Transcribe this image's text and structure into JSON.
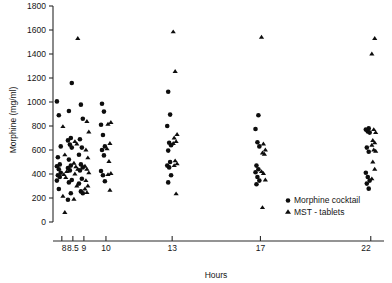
{
  "chart_data": {
    "type": "scatter",
    "title": "",
    "xlabel": "Hours",
    "ylabel": "Morphine (mg/ml)",
    "xtick_labels": [
      "8",
      "8.5",
      "9",
      "10",
      "13",
      "17",
      "22"
    ],
    "xtick_values": [
      8,
      8.5,
      9,
      10,
      13,
      17,
      22
    ],
    "ytick_labels": [
      "0",
      "200",
      "400",
      "600",
      "800",
      "1000",
      "1200",
      "1400",
      "1600",
      "1800"
    ],
    "ytick_values": [
      0,
      200,
      400,
      600,
      800,
      1000,
      1200,
      1400,
      1600,
      1800
    ],
    "ylim": [
      0,
      1800
    ],
    "xlim": [
      7.6,
      22.6
    ],
    "grid": false,
    "legend_position": "lower-right",
    "series": [
      {
        "name": "Morphine cocktail",
        "marker": "circle",
        "color": "#0d0d0d",
        "points": [
          [
            8,
            1005
          ],
          [
            8,
            890
          ],
          [
            8,
            630
          ],
          [
            8,
            540
          ],
          [
            8,
            480
          ],
          [
            8,
            465
          ],
          [
            8,
            440
          ],
          [
            8,
            410
          ],
          [
            8,
            390
          ],
          [
            8,
            375
          ],
          [
            8,
            345
          ],
          [
            8,
            275
          ],
          [
            8.5,
            1158
          ],
          [
            8.5,
            925
          ],
          [
            8.5,
            700
          ],
          [
            8.5,
            680
          ],
          [
            8.5,
            645
          ],
          [
            8.5,
            620
          ],
          [
            8.5,
            520
          ],
          [
            8.5,
            470
          ],
          [
            8.5,
            450
          ],
          [
            8.5,
            430
          ],
          [
            8.5,
            350
          ],
          [
            8.5,
            330
          ],
          [
            8.5,
            240
          ],
          [
            8.5,
            185
          ],
          [
            9,
            978
          ],
          [
            9,
            860
          ],
          [
            9,
            690
          ],
          [
            9,
            620
          ],
          [
            9,
            560
          ],
          [
            9,
            480
          ],
          [
            9,
            455
          ],
          [
            9,
            430
          ],
          [
            9,
            360
          ],
          [
            9,
            320
          ],
          [
            9,
            255
          ],
          [
            9,
            240
          ],
          [
            10,
            985
          ],
          [
            10,
            920
          ],
          [
            10,
            810
          ],
          [
            10,
            725
          ],
          [
            10,
            630
          ],
          [
            10,
            600
          ],
          [
            10,
            555
          ],
          [
            10,
            425
          ],
          [
            10,
            390
          ],
          [
            10,
            340
          ],
          [
            13,
            1085
          ],
          [
            13,
            895
          ],
          [
            13,
            800
          ],
          [
            13,
            660
          ],
          [
            13,
            640
          ],
          [
            13,
            595
          ],
          [
            13,
            500
          ],
          [
            13,
            470
          ],
          [
            13,
            455
          ],
          [
            13,
            390
          ],
          [
            13,
            330
          ],
          [
            17,
            890
          ],
          [
            17,
            775
          ],
          [
            17,
            665
          ],
          [
            17,
            630
          ],
          [
            17,
            470
          ],
          [
            17,
            440
          ],
          [
            17,
            415
          ],
          [
            17,
            375
          ],
          [
            17,
            345
          ],
          [
            17,
            315
          ],
          [
            22,
            780
          ],
          [
            22,
            770
          ],
          [
            22,
            755
          ],
          [
            22,
            745
          ],
          [
            22,
            620
          ],
          [
            22,
            585
          ],
          [
            22,
            410
          ],
          [
            22,
            375
          ],
          [
            22,
            345
          ],
          [
            22,
            320
          ],
          [
            22,
            278
          ]
        ]
      },
      {
        "name": "MST - tablets",
        "marker": "triangle",
        "color": "#0d0d0d",
        "points": [
          [
            8,
            795
          ],
          [
            8,
            560
          ],
          [
            8,
            420
          ],
          [
            8,
            395
          ],
          [
            8,
            370
          ],
          [
            8,
            215
          ],
          [
            8,
            80
          ],
          [
            8.5,
            1530
          ],
          [
            8.5,
            670
          ],
          [
            8.5,
            650
          ],
          [
            8.5,
            490
          ],
          [
            8.5,
            460
          ],
          [
            8.5,
            440
          ],
          [
            8.5,
            400
          ],
          [
            8.5,
            300
          ],
          [
            8.5,
            190
          ],
          [
            9,
            838
          ],
          [
            9,
            750
          ],
          [
            9,
            600
          ],
          [
            9,
            535
          ],
          [
            9,
            465
          ],
          [
            9,
            440
          ],
          [
            9,
            410
          ],
          [
            9,
            345
          ],
          [
            9,
            300
          ],
          [
            9,
            275
          ],
          [
            9,
            245
          ],
          [
            10,
            830
          ],
          [
            10,
            815
          ],
          [
            10,
            655
          ],
          [
            10,
            610
          ],
          [
            10,
            505
          ],
          [
            10,
            405
          ],
          [
            10,
            395
          ],
          [
            10,
            265
          ],
          [
            13,
            1585
          ],
          [
            13,
            1255
          ],
          [
            13,
            730
          ],
          [
            13,
            700
          ],
          [
            13,
            670
          ],
          [
            13,
            655
          ],
          [
            13,
            510
          ],
          [
            13,
            485
          ],
          [
            13,
            470
          ],
          [
            13,
            235
          ],
          [
            17,
            1540
          ],
          [
            17,
            650
          ],
          [
            17,
            600
          ],
          [
            17,
            575
          ],
          [
            17,
            565
          ],
          [
            17,
            420
          ],
          [
            17,
            405
          ],
          [
            17,
            350
          ],
          [
            17,
            120
          ],
          [
            22,
            1530
          ],
          [
            22,
            1400
          ],
          [
            22,
            770
          ],
          [
            22,
            745
          ],
          [
            22,
            680
          ],
          [
            22,
            660
          ],
          [
            22,
            640
          ],
          [
            22,
            600
          ],
          [
            22,
            590
          ],
          [
            22,
            500
          ],
          [
            22,
            440
          ],
          [
            22,
            360
          ]
        ]
      }
    ]
  },
  "legend": {
    "items": [
      {
        "label": "Morphine cocktail",
        "marker": "circle"
      },
      {
        "label": "MST - tablets",
        "marker": "triangle"
      }
    ]
  }
}
